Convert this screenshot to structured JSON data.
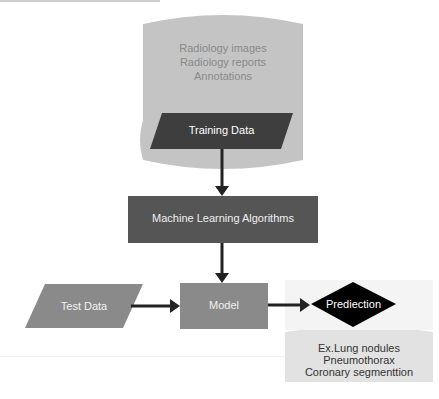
{
  "diagram": {
    "source_block": {
      "lines": [
        "Radiology images",
        "Radiology reports",
        "Annotations"
      ],
      "color": "#c4c4c4",
      "text_color": "#8a8a8a"
    },
    "training_data": {
      "label": "Training Data",
      "color": "#3e3e3e"
    },
    "ml_algorithms": {
      "label": "Machine Learning Algorithms",
      "color": "#555555"
    },
    "test_data": {
      "label": "Test Data",
      "color": "#8a8a8a"
    },
    "model": {
      "label": "Model",
      "color": "#8a8a8a"
    },
    "prediction": {
      "label": "Prediection",
      "color": "#000000"
    },
    "results_block": {
      "lines": [
        "Ex.Lung nodules",
        "Pneumothorax",
        "Coronary segmenttion"
      ],
      "color": "#e2e2e2",
      "text_color": "#333333"
    },
    "arrow_color": "#222222"
  }
}
